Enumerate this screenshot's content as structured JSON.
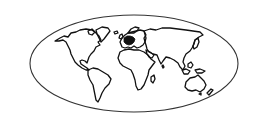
{
  "map": {
    "type": "world-outline",
    "projection": "elliptical",
    "frame": {
      "cx": 134,
      "cy": 63.5,
      "rx": 104,
      "ry": 48.5
    },
    "highlighted_region": "central-europe",
    "colors": {
      "background": "#ffffff",
      "outline": "#111111",
      "frame": "#333333",
      "highlight": "#111111"
    },
    "continents": [
      "north-america",
      "greenland",
      "south-america",
      "europe",
      "africa",
      "madagascar",
      "asia",
      "japan",
      "southeast-asia",
      "australia",
      "new-zealand"
    ]
  }
}
